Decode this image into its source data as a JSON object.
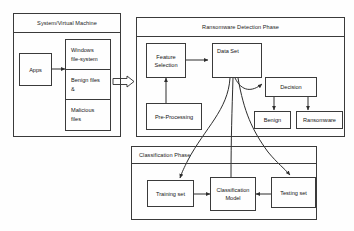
{
  "diagram": {
    "type": "flow-diagram",
    "stroke_color": "#3a3a3a",
    "text_color": "#151515",
    "background": "#fefefe"
  },
  "panels": {
    "system": {
      "header": "System/Virtual Machine",
      "nodes": {
        "apps": "Apps"
      },
      "file_list": [
        {
          "lines": [
            "Windows",
            "file-system"
          ]
        },
        {
          "lines": [
            "Benign files",
            "&"
          ]
        },
        {
          "lines": [
            "Malicious",
            "files"
          ]
        }
      ]
    },
    "detection": {
      "header": "Ransomware Detection Phase",
      "nodes": {
        "feature_selection": [
          "Feature",
          "Selection"
        ],
        "data_set": [
          "Data Set"
        ],
        "pre_processing": [
          "Pre-Processing"
        ],
        "decision": [
          "Decision"
        ],
        "benign": [
          "Benign"
        ],
        "ransomware": [
          "Ransomware"
        ]
      }
    },
    "classification": {
      "header": "Classification Phase",
      "nodes": {
        "training_set": [
          "Training set"
        ],
        "classification_model": [
          "Classification",
          "Model"
        ],
        "testing_set": [
          "Testing set"
        ]
      }
    }
  },
  "connectors": [
    {
      "name": "apps-to-files",
      "style": "solid-arrow"
    },
    {
      "name": "system-to-detection",
      "style": "block-arrow"
    },
    {
      "name": "feature-selection-to-data-set",
      "style": "solid-arrow"
    },
    {
      "name": "pre-processing-to-feature-selection",
      "style": "solid-arrow"
    },
    {
      "name": "data-set-to-decision",
      "style": "curved-arrow"
    },
    {
      "name": "decision-to-benign",
      "style": "solid-arrow"
    },
    {
      "name": "decision-to-ransomware",
      "style": "solid-arrow"
    },
    {
      "name": "data-set-to-training-set",
      "style": "curved-arrow"
    },
    {
      "name": "data-set-to-classification-model",
      "style": "curved-line"
    },
    {
      "name": "data-set-to-testing-set",
      "style": "curved-arrow"
    },
    {
      "name": "training-set-to-classification-model",
      "style": "solid-arrow"
    },
    {
      "name": "testing-set-to-classification-model",
      "style": "solid-arrow"
    }
  ]
}
